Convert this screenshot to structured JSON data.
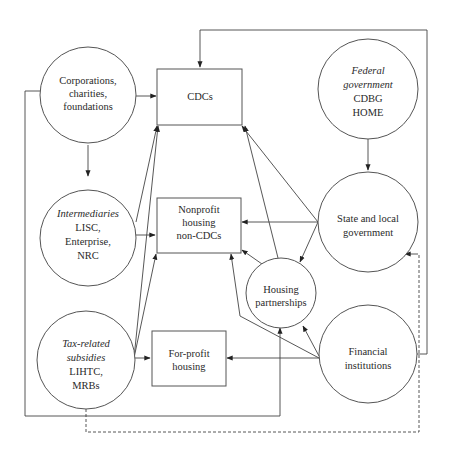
{
  "diagram": {
    "nodes": {
      "corporations": {
        "lines": [
          "Corporations,",
          "charities,",
          "foundations"
        ],
        "shape": "circle"
      },
      "cdcs": {
        "lines": [
          "CDCs"
        ],
        "shape": "box"
      },
      "federal": {
        "italic_lines": [
          "Federal",
          "government"
        ],
        "lines": [
          "CDBG",
          "HOME"
        ],
        "shape": "circle"
      },
      "intermediaries": {
        "italic_lines": [
          "Intermediaries"
        ],
        "lines": [
          "LISC,",
          "Enterprise,",
          "NRC"
        ],
        "shape": "circle"
      },
      "nonprofit": {
        "lines": [
          "Nonprofit",
          "housing",
          "non-CDCs"
        ],
        "shape": "box"
      },
      "state_local": {
        "lines": [
          "State and local",
          "government"
        ],
        "shape": "circle"
      },
      "housing_partnerships": {
        "lines": [
          "Housing",
          "partnerships"
        ],
        "shape": "circle"
      },
      "tax_related": {
        "italic_lines": [
          "Tax-related",
          "subsidies"
        ],
        "lines": [
          "LIHTC,",
          "MRBs"
        ],
        "shape": "circle"
      },
      "for_profit": {
        "lines": [
          "For-profit",
          "housing"
        ],
        "shape": "box"
      },
      "financial": {
        "lines": [
          "Financial",
          "institutions"
        ],
        "shape": "circle"
      }
    },
    "edges": [
      {
        "from": "corporations",
        "to": "cdcs",
        "style": "solid"
      },
      {
        "from": "corporations",
        "to": "intermediaries",
        "style": "solid"
      },
      {
        "from": "corporations",
        "to": "housing_partnerships",
        "style": "solid",
        "routing": "outer-left-loop"
      },
      {
        "from": "federal",
        "to": "state_local",
        "style": "solid"
      },
      {
        "from": "intermediaries",
        "to": "cdcs",
        "style": "solid"
      },
      {
        "from": "intermediaries",
        "to": "nonprofit",
        "style": "solid"
      },
      {
        "from": "state_local",
        "to": "cdcs",
        "style": "solid"
      },
      {
        "from": "state_local",
        "to": "nonprofit",
        "style": "solid"
      },
      {
        "from": "state_local",
        "to": "housing_partnerships",
        "style": "solid"
      },
      {
        "from": "housing_partnerships",
        "to": "cdcs",
        "style": "solid"
      },
      {
        "from": "housing_partnerships",
        "to": "nonprofit",
        "style": "solid"
      },
      {
        "from": "tax_related",
        "to": "cdcs",
        "style": "solid"
      },
      {
        "from": "tax_related",
        "to": "nonprofit",
        "style": "solid"
      },
      {
        "from": "tax_related",
        "to": "for_profit",
        "style": "solid"
      },
      {
        "from": "tax_related",
        "to": "state_local",
        "style": "dashed"
      },
      {
        "from": "financial",
        "to": "cdcs",
        "style": "solid",
        "routing": "outer-top-loop"
      },
      {
        "from": "financial",
        "to": "nonprofit",
        "style": "solid"
      },
      {
        "from": "financial",
        "to": "housing_partnerships",
        "style": "solid"
      },
      {
        "from": "financial",
        "to": "for_profit",
        "style": "solid"
      }
    ]
  }
}
